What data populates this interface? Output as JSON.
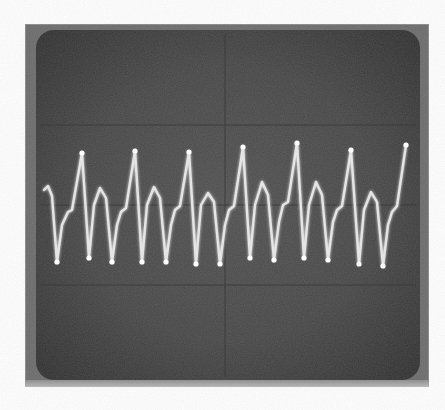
{
  "image": {
    "subject": "oscilloscope-screen-photo",
    "colors": {
      "bezel": "#6a6a6a",
      "screen": "#484848",
      "trace": "#f2f2f2",
      "graticule": "#3a3a3a"
    }
  },
  "graticule": {
    "horizontal_lines_y": [
      125,
      205,
      285
    ],
    "vertical_lines_x": [
      225
    ]
  },
  "chart_data": {
    "type": "line",
    "title": "",
    "xlabel": "",
    "ylabel": "",
    "period_px": 53.7,
    "cycles_visible": 7,
    "points": [
      [
        44,
        190
      ],
      [
        48,
        186
      ],
      [
        52,
        196
      ],
      [
        57,
        262
      ],
      [
        62,
        225
      ],
      [
        68,
        212
      ],
      [
        72,
        210
      ],
      [
        82,
        153
      ],
      [
        89,
        258
      ],
      [
        94,
        205
      ],
      [
        100,
        188
      ],
      [
        106,
        198
      ],
      [
        112,
        262
      ],
      [
        117,
        225
      ],
      [
        121,
        212
      ],
      [
        126,
        208
      ],
      [
        135,
        151
      ],
      [
        142,
        262
      ],
      [
        147,
        205
      ],
      [
        154,
        187
      ],
      [
        160,
        198
      ],
      [
        166,
        262
      ],
      [
        171,
        225
      ],
      [
        175,
        210
      ],
      [
        180,
        206
      ],
      [
        189,
        152
      ],
      [
        196,
        264
      ],
      [
        201,
        205
      ],
      [
        208,
        193
      ],
      [
        214,
        202
      ],
      [
        220,
        264
      ],
      [
        225,
        225
      ],
      [
        229,
        210
      ],
      [
        234,
        206
      ],
      [
        243,
        147
      ],
      [
        250,
        258
      ],
      [
        255,
        205
      ],
      [
        262,
        182
      ],
      [
        268,
        195
      ],
      [
        274,
        260
      ],
      [
        279,
        222
      ],
      [
        283,
        205
      ],
      [
        288,
        202
      ],
      [
        297,
        143
      ],
      [
        304,
        258
      ],
      [
        309,
        205
      ],
      [
        316,
        182
      ],
      [
        322,
        195
      ],
      [
        328,
        260
      ],
      [
        333,
        222
      ],
      [
        337,
        210
      ],
      [
        342,
        206
      ],
      [
        351,
        150
      ],
      [
        359,
        264
      ],
      [
        364,
        210
      ],
      [
        371,
        192
      ],
      [
        377,
        202
      ],
      [
        383,
        266
      ],
      [
        388,
        225
      ],
      [
        392,
        212
      ],
      [
        397,
        206
      ],
      [
        406,
        145
      ]
    ],
    "peaks_x": [
      82,
      135,
      189,
      243,
      297,
      351,
      406
    ],
    "troughs_x": [
      57,
      89,
      112,
      142,
      166,
      196,
      220,
      250,
      274,
      304,
      328,
      359,
      383
    ]
  }
}
